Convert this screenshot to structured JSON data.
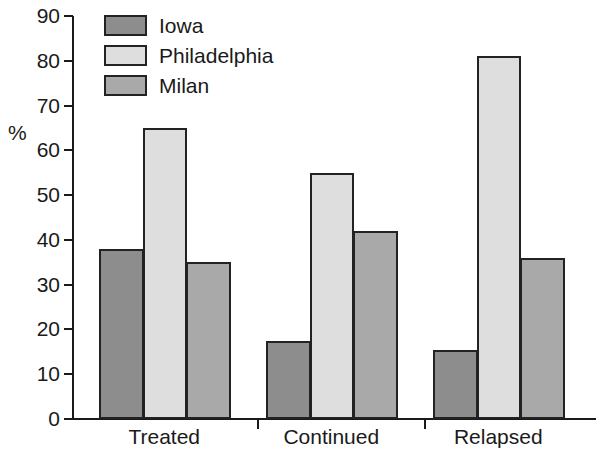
{
  "chart_data": {
    "type": "bar",
    "title": "",
    "subtitle": "",
    "xlabel": "",
    "ylabel": "%",
    "ylim": [
      0,
      90
    ],
    "ytick_step": 10,
    "yticks": [
      "90",
      "80",
      "70",
      "60",
      "50",
      "40",
      "30",
      "20",
      "10",
      "0"
    ],
    "grid": false,
    "legend_position": "top-left",
    "categories": [
      "Treated",
      "Continued",
      "Relapsed"
    ],
    "series": [
      {
        "name": "Iowa",
        "color": "#8d8d8d",
        "values": [
          38,
          17.5,
          15.5
        ]
      },
      {
        "name": "Philadelphia",
        "color": "#dedede",
        "values": [
          65,
          55,
          81
        ]
      },
      {
        "name": "Milan",
        "color": "#a9a9a9",
        "values": [
          35,
          42,
          36
        ]
      }
    ]
  },
  "axis": {
    "y_title": "%",
    "tick_labels": [
      "90",
      "80",
      "70",
      "60",
      "50",
      "40",
      "30",
      "20",
      "10",
      "0"
    ],
    "category_labels": [
      "Treated",
      "Continued",
      "Relapsed"
    ]
  },
  "legend": {
    "items": [
      {
        "label": "Iowa",
        "key": "iowa"
      },
      {
        "label": "Philadelphia",
        "key": "philadelphia"
      },
      {
        "label": "Milan",
        "key": "milan"
      }
    ]
  },
  "colors": {
    "iowa": "#8d8d8d",
    "philadelphia": "#dedede",
    "milan": "#a9a9a9",
    "axis": "#1a1a1a",
    "bar_outline": "#222222",
    "background": "#ffffff"
  }
}
